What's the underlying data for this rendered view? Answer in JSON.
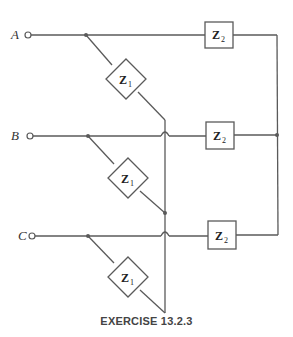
{
  "diagram": {
    "type": "three-phase circuit",
    "terminals": [
      {
        "label": "A"
      },
      {
        "label": "B"
      },
      {
        "label": "C"
      }
    ],
    "components": {
      "z1": {
        "main": "Z",
        "sub": "1"
      },
      "z2": {
        "main": "Z",
        "sub": "2"
      }
    },
    "caption": "EXERCISE 13.2.3"
  }
}
